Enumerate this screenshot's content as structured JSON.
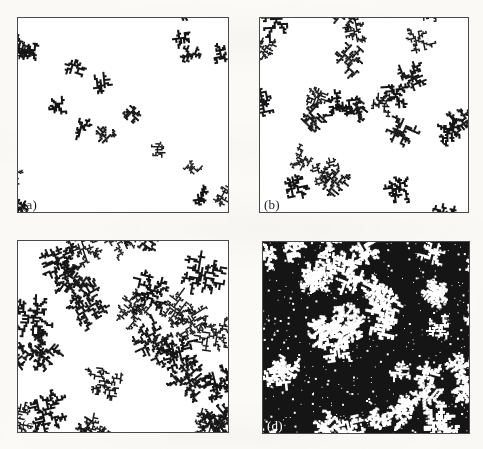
{
  "figure": {
    "type": "multi-panel-fractal-aggregation-figure",
    "background_color": "#fbfaf7",
    "ink_color": "#151515",
    "paper_color": "#ffffff",
    "border_color": "#4a4a4a",
    "panel_count": 4,
    "columns": 2,
    "rows": 2
  },
  "chart_data": {
    "type": "scatter",
    "title": "",
    "subtitle": "",
    "xlabel": "",
    "ylabel": "",
    "grid": false,
    "legend_position": "none",
    "panels": [
      {
        "id": "a",
        "label": "(a)",
        "label_color": "#1b1b1b",
        "coverage_fraction": 0.06,
        "cluster_count": 22,
        "mean_cluster_radius_px": 17,
        "inverted": false,
        "seed": 10427,
        "x": 17,
        "y": 17,
        "width": 212,
        "height": 196
      },
      {
        "id": "b",
        "label": "(b)",
        "label_color": "#1b1b1b",
        "coverage_fraction": 0.14,
        "cluster_count": 24,
        "mean_cluster_radius_px": 25,
        "inverted": false,
        "seed": 20731,
        "x": 259,
        "y": 17,
        "width": 210,
        "height": 196
      },
      {
        "id": "c",
        "label": "(c)",
        "label_color": "#1b1b1b",
        "coverage_fraction": 0.3,
        "cluster_count": 26,
        "mean_cluster_radius_px": 37,
        "inverted": false,
        "seed": 30859,
        "x": 17,
        "y": 240,
        "width": 212,
        "height": 193
      },
      {
        "id": "d",
        "label": "(d)",
        "label_color": "#ffffff",
        "coverage_fraction": 0.74,
        "cluster_count": 30,
        "mean_cluster_radius_px": 62,
        "inverted": true,
        "seed": 40993,
        "x": 262,
        "y": 241,
        "width": 208,
        "height": 193
      }
    ],
    "series": [
      {
        "name": "coverage fraction",
        "categories": [
          "(a)",
          "(b)",
          "(c)",
          "(d)"
        ],
        "values": [
          0.06,
          0.14,
          0.3,
          0.74
        ]
      },
      {
        "name": "mean cluster radius (px)",
        "categories": [
          "(a)",
          "(b)",
          "(c)",
          "(d)"
        ],
        "values": [
          17,
          25,
          37,
          62
        ]
      },
      {
        "name": "cluster count",
        "categories": [
          "(a)",
          "(b)",
          "(c)",
          "(d)"
        ],
        "values": [
          22,
          24,
          26,
          30
        ]
      }
    ]
  }
}
